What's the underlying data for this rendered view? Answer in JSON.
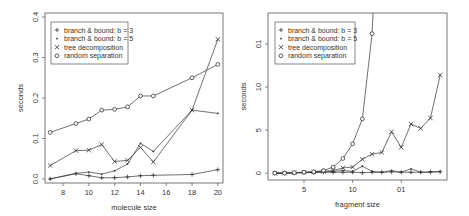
{
  "chart_data": [
    {
      "type": "line",
      "title": "",
      "xlabel": "molecule size",
      "ylabel": "seconds",
      "xlim": [
        6.6,
        20.4
      ],
      "ylim": [
        -0.01,
        0.41
      ],
      "xticks": [
        8,
        10,
        12,
        14,
        16,
        18,
        20
      ],
      "xtick_labels": [
        "8",
        "10",
        "12",
        "14",
        "16",
        "18",
        "20"
      ],
      "yticks": [
        0.0,
        0.1,
        0.2,
        0.3,
        0.4
      ],
      "ytick_labels": [
        "0.0",
        "0.1",
        "0.2",
        "0.3",
        "0.4"
      ],
      "grid": false,
      "legend_position": "top-left",
      "x": [
        7,
        9,
        10,
        11,
        12,
        13,
        14,
        15,
        18,
        20
      ],
      "series": [
        {
          "name": "branch & bound: b = 3",
          "marker": "+",
          "values": [
            0.0,
            0.013,
            0.008,
            0.003,
            0.003,
            0.005,
            0.008,
            0.009,
            0.011,
            0.023
          ]
        },
        {
          "name": "branch & bound: b = 5",
          "marker": "•",
          "values": [
            0.0,
            0.014,
            0.017,
            0.012,
            0.02,
            0.037,
            0.088,
            0.068,
            0.17,
            0.162
          ]
        },
        {
          "name": "tree decomposition",
          "marker": "x",
          "values": [
            0.033,
            0.07,
            0.071,
            0.085,
            0.043,
            0.046,
            0.078,
            0.042,
            0.17,
            0.345
          ]
        },
        {
          "name": "random separation",
          "marker": "o",
          "values": [
            0.115,
            0.137,
            0.148,
            0.17,
            0.172,
            0.178,
            0.205,
            0.205,
            0.25,
            0.283
          ]
        }
      ]
    },
    {
      "type": "line",
      "title": "",
      "xlabel": "fragment size",
      "ylabel": "seconds",
      "xlim": [
        1.3,
        19.7
      ],
      "ylim": [
        -0.8,
        18.6
      ],
      "xticks": [
        5,
        10,
        15
      ],
      "xtick_labels": [
        "5",
        "10",
        "01"
      ],
      "yticks": [
        0,
        5,
        10,
        15
      ],
      "ytick_labels": [
        "0",
        "5",
        "10",
        "01"
      ],
      "grid": false,
      "legend_position": "top-left",
      "x": [
        2,
        3,
        4,
        5,
        6,
        7,
        8,
        9,
        10,
        11,
        12,
        13,
        14,
        15,
        16,
        17,
        18,
        19
      ],
      "series": [
        {
          "name": "branch & bound: b = 3",
          "marker": "+",
          "values": [
            0.0,
            0.0,
            0.0,
            0.05,
            0.05,
            0.1,
            0.1,
            0.1,
            0.1,
            0.05,
            0.1,
            0.1,
            0.15,
            0.1,
            0.1,
            0.1,
            0.15,
            0.15
          ]
        },
        {
          "name": "branch & bound: b = 5",
          "marker": "•",
          "values": [
            0.0,
            0.0,
            0.05,
            0.05,
            0.1,
            0.15,
            0.2,
            0.3,
            0.2,
            0.8,
            0.2,
            0.1,
            0.3,
            0.1,
            0.5,
            0.1,
            0.1,
            0.2
          ]
        },
        {
          "name": "tree decomposition",
          "marker": "x",
          "values": [
            0.0,
            0.0,
            0.05,
            0.1,
            0.15,
            0.2,
            0.3,
            0.6,
            0.7,
            1.6,
            2.2,
            2.4,
            4.8,
            3.0,
            5.7,
            5.2,
            6.4,
            11.4
          ]
        },
        {
          "name": "random separation",
          "marker": "o",
          "values": [
            0.0,
            0.0,
            0.05,
            0.1,
            0.15,
            0.3,
            0.7,
            1.7,
            3.4,
            6.3,
            16.2,
            40,
            null,
            null,
            null,
            null,
            null,
            null
          ]
        }
      ]
    }
  ],
  "legend_labels": [
    "branch & bound: b = 3",
    "branch & bound: b = 5",
    "tree decomposition",
    "random separation"
  ],
  "legend_markers": [
    "+",
    "•",
    "x",
    "o"
  ],
  "colors": {
    "line": "#333333",
    "axis": "#555555",
    "text": "#333333"
  }
}
